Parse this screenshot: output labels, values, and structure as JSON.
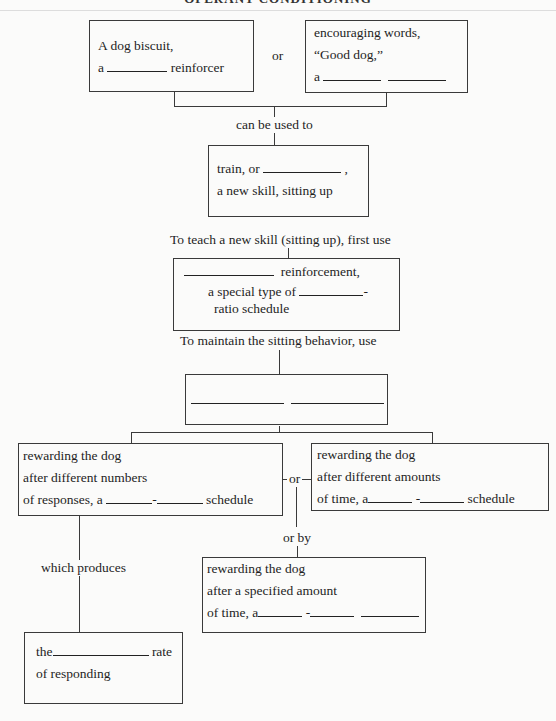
{
  "header": {
    "title": "OPERANT CONDITIONING"
  },
  "boxes": {
    "biscuit": {
      "line1": "A dog biscuit,",
      "line2_pre": "a",
      "line2_post": "reinforcer"
    },
    "words": {
      "line1": "encouraging words,",
      "line2": "“Good dog,”",
      "line3_pre": "a"
    },
    "train": {
      "line1_pre": "train, or",
      "line1_post": ",",
      "line2": "a new skill, sitting up"
    },
    "ratio": {
      "line1_post": "reinforcement,",
      "line2_pre": "a special type of",
      "line2_post": "-",
      "line3": "ratio schedule"
    },
    "maintain": {},
    "numbers": {
      "line1": "rewarding the dog",
      "line2": "after different numbers",
      "line3_pre": "of responses, a",
      "line3_mid": "-",
      "line3_post": "schedule"
    },
    "amounts": {
      "line1": "rewarding the dog",
      "line2": "after different amounts",
      "line3_pre": "of time, a",
      "line3_mid": "-",
      "line3_post": "schedule"
    },
    "specified": {
      "line1": "rewarding the dog",
      "line2": "after a specified amount",
      "line3_pre": "of time, a",
      "line3_mid": "-"
    },
    "rate": {
      "line1_pre": "the",
      "line1_post": "rate",
      "line2": "of responding"
    }
  },
  "connectors": {
    "or_top": "or",
    "can_be_used_to": "can be used to",
    "to_teach": "To teach a new skill (sitting up), first use",
    "to_maintain": "To maintain the sitting behavior, use",
    "either_by": "either by",
    "or_middle": "or",
    "or_by": "or by",
    "which_produces": "which produces"
  }
}
